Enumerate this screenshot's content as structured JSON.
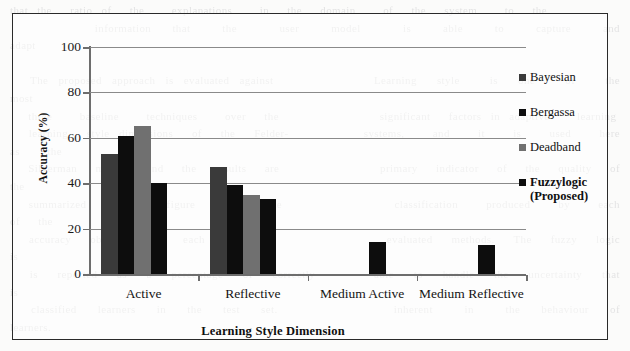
{
  "paper": {
    "bleed_text": "that the  ratio of  the   explanations   in  the  domain   of  the  system   to  the\n        information  that   the    user   model    is   able   to   capture   and   adapt\n\n  The proposed approach is evaluated against          Learning  style   is  one   of   the   most\n  three   baseline   techniques   over  the           significant  factors in adaptive   learning\n  learning  style dimensions  of  the  Felder-        systems,   and   it   is   used   here   as   the\n  Silverman  model,  and  the  results  are           primary  indicator  of  the  quality  of  the\n  summarized  in  the  figure  below.  The            classification   produced   by   each   of  the\n  accuracy  obtained  for  each  dimension            evaluated  methods.  The  fuzzy  logic  is\n  is  reported  as  a  percentage  of  correctly      able  to  handle  the  uncertainty  that  is\n  classified  learners  in  the  test  set.           inherent   in   the  behaviour  of  learners.\n\n  It  can  be  observed  that  the  proposed          model  obtains   a   lower   accuracy   on   the\n  active  and   reflective   dimensions   than        the  other  approaches,  yet  it  is  the  only\n  technique   that   produces   a   result   for      the  medium  categories  of  both  learning\n  style  dimensions,  which  the  remaining           methods   are   unable   to   classify   at   all.\n  This  property  is  particularly  relevant          when  learners  do  not  exhibit  a  strong\n  preference  towards  one  of  the  poles  of        any  given  learning  style  dimension."
  },
  "chart_data": {
    "type": "bar",
    "title": "",
    "xlabel": "Learning Style Dimension",
    "ylabel": "Accuracy (%)",
    "ylim": [
      0,
      100
    ],
    "yticks": [
      0,
      20,
      40,
      60,
      80,
      100
    ],
    "grid": true,
    "legend_position": "right",
    "categories": [
      "Active",
      "Reflective",
      "Medium Active",
      "Medium Reflective"
    ],
    "series": [
      {
        "name": "Bayesian",
        "color": "#3a3a3a",
        "values": [
          53,
          47,
          0,
          0
        ]
      },
      {
        "name": "Bergassa",
        "color": "#0d0d0d",
        "values": [
          61,
          39,
          0,
          0
        ]
      },
      {
        "name": "Deadband",
        "color": "#707070",
        "values": [
          65,
          35,
          0,
          0
        ]
      },
      {
        "name": "Fuzzylogic\n(Proposed)",
        "color": "#0d0d0d",
        "values": [
          40,
          33,
          14,
          13
        ]
      }
    ]
  },
  "legend": {
    "items": [
      {
        "label": "Bayesian",
        "color": "#3a3a3a",
        "emphasis": false
      },
      {
        "label": "Bergassa",
        "color": "#0d0d0d",
        "emphasis": false
      },
      {
        "label": "Deadband",
        "color": "#707070",
        "emphasis": false
      },
      {
        "label": "Fuzzylogic\n(Proposed)",
        "color": "#0d0d0d",
        "emphasis": true
      }
    ]
  }
}
